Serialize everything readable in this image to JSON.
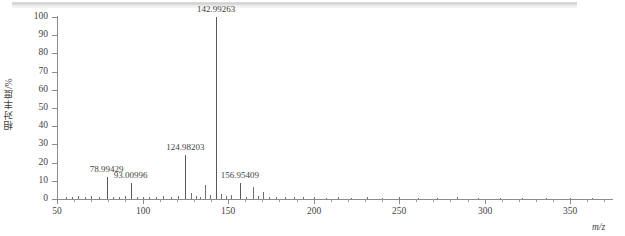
{
  "figure": {
    "y_axis_title": "相对丰度/%",
    "x_axis_title": "m/z"
  },
  "chart_data": {
    "type": "bar",
    "title": "",
    "subtitle": "",
    "xlabel": "m/z",
    "ylabel": "相对丰度/%",
    "xlim": [
      50,
      375
    ],
    "ylim": [
      0,
      100
    ],
    "grid": false,
    "legend": null,
    "x_ticks": [
      50,
      100,
      150,
      200,
      250,
      300,
      350
    ],
    "x_tick_labels": [
      "50",
      "100",
      "150",
      "200",
      "250",
      "300",
      "350"
    ],
    "x_minor_tick_step": 10,
    "y_ticks": [
      0,
      10,
      20,
      30,
      40,
      50,
      60,
      70,
      80,
      90,
      100
    ],
    "y_tick_labels": [
      "0",
      "10",
      "20",
      "30",
      "40",
      "50",
      "60",
      "70",
      "80",
      "90",
      "100"
    ],
    "annotations": [
      {
        "mz": 78.99429,
        "label": "78.99429",
        "intensity": 12
      },
      {
        "mz": 93.00996,
        "label": "93.00996",
        "intensity": 9
      },
      {
        "mz": 124.98203,
        "label": "124.98203",
        "intensity": 24
      },
      {
        "mz": 142.99263,
        "label": "142.99263",
        "intensity": 100
      },
      {
        "mz": 156.95409,
        "label": "156.95409",
        "intensity": 9
      }
    ],
    "peaks": [
      {
        "mz": 55.0,
        "intensity": 1.2
      },
      {
        "mz": 58.5,
        "intensity": 1.0
      },
      {
        "mz": 62.0,
        "intensity": 1.8
      },
      {
        "mz": 66.5,
        "intensity": 1.1
      },
      {
        "mz": 70.0,
        "intensity": 1.4
      },
      {
        "mz": 74.5,
        "intensity": 1.0
      },
      {
        "mz": 78.99429,
        "intensity": 12.0
      },
      {
        "mz": 82.5,
        "intensity": 1.3
      },
      {
        "mz": 86.0,
        "intensity": 1.1
      },
      {
        "mz": 89.5,
        "intensity": 1.5
      },
      {
        "mz": 93.00996,
        "intensity": 9.0
      },
      {
        "mz": 96.5,
        "intensity": 1.2
      },
      {
        "mz": 100.5,
        "intensity": 1.0
      },
      {
        "mz": 104.0,
        "intensity": 1.3
      },
      {
        "mz": 108.0,
        "intensity": 1.1
      },
      {
        "mz": 112.0,
        "intensity": 1.4
      },
      {
        "mz": 116.5,
        "intensity": 1.2
      },
      {
        "mz": 120.5,
        "intensity": 1.6
      },
      {
        "mz": 124.98203,
        "intensity": 24.0
      },
      {
        "mz": 128.5,
        "intensity": 3.5
      },
      {
        "mz": 131.0,
        "intensity": 1.6
      },
      {
        "mz": 133.5,
        "intensity": 1.2
      },
      {
        "mz": 136.5,
        "intensity": 7.5
      },
      {
        "mz": 139.5,
        "intensity": 2.0
      },
      {
        "mz": 142.99263,
        "intensity": 100.0
      },
      {
        "mz": 146.0,
        "intensity": 2.8
      },
      {
        "mz": 148.5,
        "intensity": 1.4
      },
      {
        "mz": 151.5,
        "intensity": 2.2
      },
      {
        "mz": 156.95409,
        "intensity": 9.0
      },
      {
        "mz": 160.5,
        "intensity": 1.3
      },
      {
        "mz": 164.5,
        "intensity": 6.5
      },
      {
        "mz": 167.5,
        "intensity": 1.5
      },
      {
        "mz": 170.5,
        "intensity": 4.0
      },
      {
        "mz": 174.0,
        "intensity": 1.2
      },
      {
        "mz": 178.0,
        "intensity": 1.0
      },
      {
        "mz": 183.0,
        "intensity": 0.9
      },
      {
        "mz": 188.5,
        "intensity": 1.1
      },
      {
        "mz": 194.0,
        "intensity": 0.9
      },
      {
        "mz": 200.0,
        "intensity": 1.0
      },
      {
        "mz": 207.0,
        "intensity": 0.8
      },
      {
        "mz": 214.0,
        "intensity": 0.9
      },
      {
        "mz": 222.0,
        "intensity": 0.8
      },
      {
        "mz": 231.0,
        "intensity": 0.9
      },
      {
        "mz": 240.0,
        "intensity": 0.8
      },
      {
        "mz": 250.0,
        "intensity": 0.9
      },
      {
        "mz": 261.0,
        "intensity": 0.8
      },
      {
        "mz": 272.0,
        "intensity": 0.8
      },
      {
        "mz": 284.0,
        "intensity": 0.9
      },
      {
        "mz": 296.0,
        "intensity": 0.8
      },
      {
        "mz": 309.0,
        "intensity": 0.8
      },
      {
        "mz": 322.0,
        "intensity": 0.8
      },
      {
        "mz": 336.0,
        "intensity": 0.8
      },
      {
        "mz": 350.0,
        "intensity": 0.8
      },
      {
        "mz": 363.0,
        "intensity": 0.8
      }
    ]
  }
}
